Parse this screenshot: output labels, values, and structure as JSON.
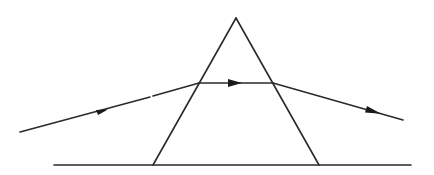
{
  "diagram": {
    "type": "ray-optics",
    "elements": [
      {
        "name": "prism",
        "shape": "triangle"
      },
      {
        "name": "surface",
        "shape": "line"
      },
      {
        "name": "incident-ray",
        "direction": "left-to-right",
        "has_arrow": true
      },
      {
        "name": "internal-ray",
        "direction": "left-to-right",
        "has_arrow": true
      },
      {
        "name": "emergent-ray",
        "direction": "left-to-right",
        "has_arrow": true
      }
    ],
    "colors": {
      "stroke": "#2a2a2a",
      "background": "#ffffff"
    }
  }
}
